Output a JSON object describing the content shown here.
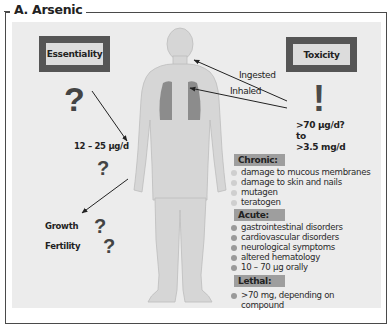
{
  "figure": {
    "title": "A. Arsenic",
    "essentiality": {
      "label": "Essentiality",
      "question_mark": "?",
      "dose": "12 – 25 µg/d",
      "dose_question": "?",
      "effects": [
        {
          "label": "Growth",
          "mark": "?"
        },
        {
          "label": "Fertility",
          "mark": "?"
        }
      ]
    },
    "toxicity": {
      "label": "Toxicity",
      "exclamation": "!",
      "dose_line1": ">70 µg/d?",
      "dose_line2": "to",
      "dose_line3": ">3.5 mg/d",
      "routes": {
        "ingested": "Ingested",
        "inhaled": "Inhaled"
      },
      "sections": {
        "chronic": {
          "label": "Chronic:",
          "items": [
            "damage to mucous membranes",
            "damage to skin and nails",
            "mutagen",
            "teratogen"
          ]
        },
        "acute": {
          "label": "Acute:",
          "items": [
            "gastrointestinal disorders",
            "cardiovascular disorders",
            "neurological symptoms",
            "altered hematology",
            "10 – 70 µg orally"
          ]
        },
        "lethal": {
          "label": "Lethal:",
          "items": [
            ">70 mg, depending on",
            "compound"
          ]
        }
      }
    },
    "colors": {
      "panel_bg": "#ececec",
      "box_border": "#555555",
      "box_fill": "#dcdcdc",
      "body_fill": "#d4d4d4",
      "lung_fill": "#8a8a8a",
      "section_label_bg": "#9e9e9e"
    }
  }
}
